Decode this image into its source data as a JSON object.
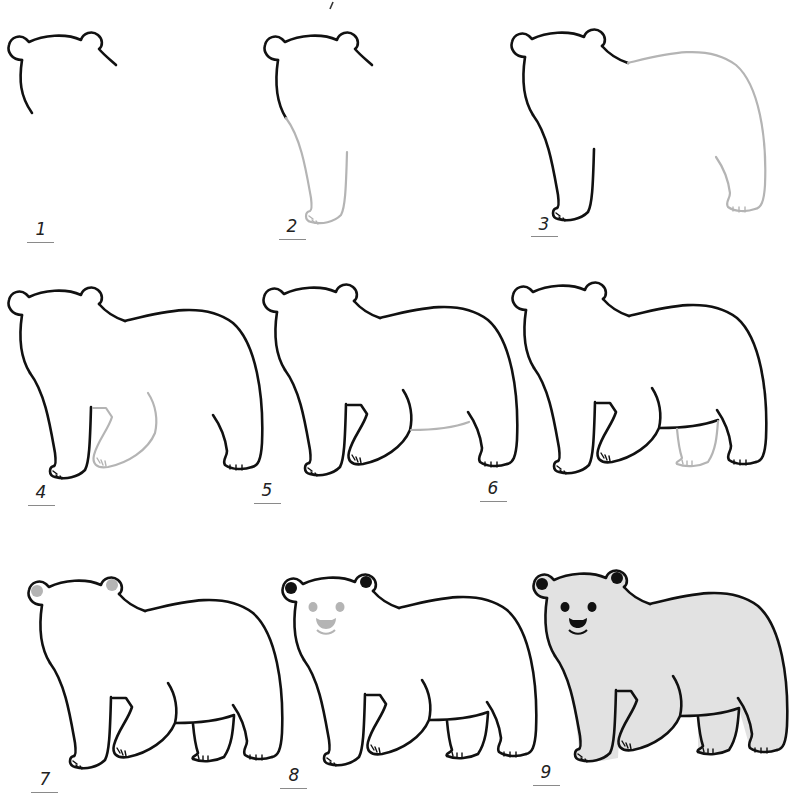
{
  "colors": {
    "line": "#111111",
    "guide_line": "#b4b4b4",
    "ear_inner_step7": "#b4b4b4",
    "face_step8": "#b4b4b4",
    "fur_fill_step9": "#e2e2e2",
    "background": "#ffffff"
  },
  "steps": [
    {
      "number": "1",
      "description": "Head outline with two ears and start of front leg"
    },
    {
      "number": "2",
      "description": "Front leg and paw (new lines in gray)"
    },
    {
      "number": "3",
      "description": "Back, rump and rear leg (new lines in gray)"
    },
    {
      "number": "4",
      "description": "Inner front leg, second front leg bent (gray)"
    },
    {
      "number": "5",
      "description": "Belly line (gray)"
    },
    {
      "number": "6",
      "description": "Second rear leg (gray)"
    },
    {
      "number": "7",
      "description": "Inner ears shaded"
    },
    {
      "number": "8",
      "description": "Eyes, nose and mouth (gray), ears filled black"
    },
    {
      "number": "9",
      "description": "Completed bear with eyes, nose, smile and gray fur fill"
    }
  ]
}
